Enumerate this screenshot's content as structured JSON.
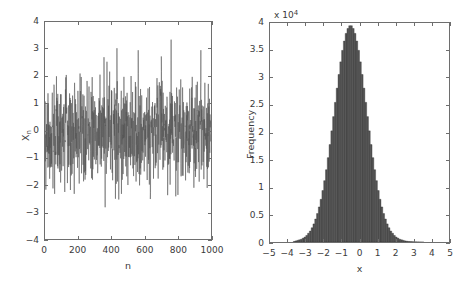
{
  "figure": {
    "background": "#ffffff",
    "axis_color": "#6e6e6e",
    "text_color": "#3a3a3a",
    "data_color": "#555555"
  },
  "chart_data": [
    {
      "type": "line",
      "panel": "left",
      "title": "",
      "subtitle": "",
      "xlabel": "n",
      "ylabel": "X_n",
      "ylabel_base": "X",
      "ylabel_sub": "n",
      "xlim": [
        0,
        1000
      ],
      "ylim": [
        -4,
        4
      ],
      "xticks": [
        0,
        200,
        400,
        600,
        800,
        1000
      ],
      "xtick_labels": [
        "0",
        "200",
        "400",
        "600",
        "800",
        "1000"
      ],
      "yticks": [
        -4,
        -3,
        -2,
        -1,
        0,
        1,
        2,
        3,
        4
      ],
      "ytick_labels": [
        "-4",
        "-3",
        "-2",
        "-1",
        "0",
        "1",
        "2",
        "3",
        "4"
      ],
      "grid": false,
      "legend": "none",
      "series_name": "white noise sample path",
      "description": "Gaussian white noise realization, 1000 samples, zero mean, unit standard deviation",
      "n_points": 1000,
      "mean": 0,
      "std": 1,
      "observed_max": 3.35,
      "observed_min": -3.4,
      "seed": 20240516
    },
    {
      "type": "bar",
      "panel": "right",
      "title": "",
      "subtitle": "",
      "xlabel": "x",
      "ylabel": "Frequency",
      "y_multiplier_text": "x 10",
      "y_multiplier_exponent": "4",
      "y_multiplier_value": 10000,
      "xlim": [
        -5,
        5
      ],
      "ylim": [
        0,
        4
      ],
      "xticks": [
        -5,
        -4,
        -3,
        -2,
        -1,
        0,
        1,
        2,
        3,
        4,
        5
      ],
      "xtick_labels": [
        "-5",
        "-4",
        "-3",
        "-2",
        "-1",
        "0",
        "1",
        "2",
        "3",
        "4",
        "5"
      ],
      "yticks": [
        0,
        0.5,
        1,
        1.5,
        2,
        2.5,
        3,
        3.5,
        4
      ],
      "ytick_labels": [
        "0",
        "0.5",
        "1",
        "1.5",
        "2",
        "2.5",
        "3",
        "3.5",
        "4"
      ],
      "grid": false,
      "legend": "none",
      "description": "Histogram of one million Gaussian samples, bin width 0.1, peak near 3.95e4 at x = 0",
      "bin_width": 0.1,
      "peak_value": 3.95,
      "peak_x": 0.0,
      "bin_centers": [
        -3.65,
        -3.55,
        -3.45,
        -3.35,
        -3.25,
        -3.15,
        -3.05,
        -2.95,
        -2.85,
        -2.75,
        -2.65,
        -2.55,
        -2.45,
        -2.35,
        -2.25,
        -2.15,
        -2.05,
        -1.95,
        -1.85,
        -1.75,
        -1.65,
        -1.55,
        -1.45,
        -1.35,
        -1.25,
        -1.15,
        -1.05,
        -0.95,
        -0.85,
        -0.75,
        -0.65,
        -0.55,
        -0.45,
        -0.35,
        -0.25,
        -0.15,
        -0.05,
        0.05,
        0.15,
        0.25,
        0.35,
        0.45,
        0.55,
        0.65,
        0.75,
        0.85,
        0.95,
        1.05,
        1.15,
        1.25,
        1.35,
        1.45,
        1.55,
        1.65,
        1.75,
        1.85,
        1.95,
        2.05,
        2.15,
        2.25,
        2.35,
        2.45,
        2.55,
        2.65,
        2.75,
        2.85,
        2.95,
        3.05,
        3.15,
        3.25,
        3.35,
        3.45,
        3.55
      ],
      "values": [
        0.01,
        0.02,
        0.03,
        0.04,
        0.05,
        0.07,
        0.09,
        0.12,
        0.16,
        0.2,
        0.26,
        0.33,
        0.42,
        0.52,
        0.64,
        0.78,
        0.94,
        1.12,
        1.32,
        1.54,
        1.78,
        2.03,
        2.29,
        2.55,
        2.81,
        3.06,
        3.29,
        3.5,
        3.67,
        3.81,
        3.9,
        3.95,
        3.95,
        3.9,
        3.81,
        3.67,
        3.5,
        3.29,
        3.06,
        2.81,
        2.55,
        2.29,
        2.03,
        1.78,
        1.54,
        1.32,
        1.12,
        0.94,
        0.78,
        0.64,
        0.52,
        0.42,
        0.33,
        0.26,
        0.2,
        0.16,
        0.12,
        0.09,
        0.07,
        0.05,
        0.04,
        0.03,
        0.02,
        0.015,
        0.01,
        0.008,
        0.006,
        0.004,
        0.003,
        0.002,
        0.0015,
        0.001,
        0.0005
      ]
    }
  ]
}
